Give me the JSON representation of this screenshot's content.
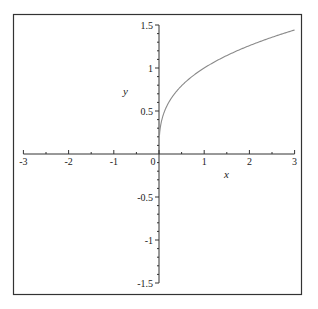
{
  "chart_data": {
    "type": "line",
    "title": "",
    "xlabel": "x",
    "ylabel": "y",
    "xlim": [
      -3,
      3
    ],
    "ylim": [
      -1.5,
      1.5
    ],
    "grid": false,
    "legend": null,
    "x_ticks": [
      -3,
      -2,
      -1,
      0,
      1,
      2,
      3
    ],
    "x_tick_labels": [
      "-3",
      "-2",
      "-1",
      "0",
      "1",
      "2",
      "3"
    ],
    "y_ticks": [
      -1.5,
      -1,
      -0.5,
      0.5,
      1,
      1.5
    ],
    "y_tick_labels": [
      "-1.5",
      "-1",
      "-0.5",
      "0.5",
      "1",
      "1.5"
    ],
    "series": [
      {
        "name": "y = x^(1/3)",
        "color": "#8a8a8a",
        "x": [
          0.01,
          0.05,
          0.1,
          0.2,
          0.3,
          0.5,
          0.75,
          1.0,
          1.25,
          1.5,
          1.75,
          2.0,
          2.25,
          2.5,
          2.75,
          3.0
        ],
        "y": [
          0.215,
          0.368,
          0.464,
          0.585,
          0.669,
          0.794,
          0.909,
          1.0,
          1.077,
          1.145,
          1.205,
          1.26,
          1.31,
          1.357,
          1.401,
          1.442
        ]
      }
    ]
  },
  "frame": {
    "border_color": "#333333",
    "axis_color": "#333333"
  }
}
